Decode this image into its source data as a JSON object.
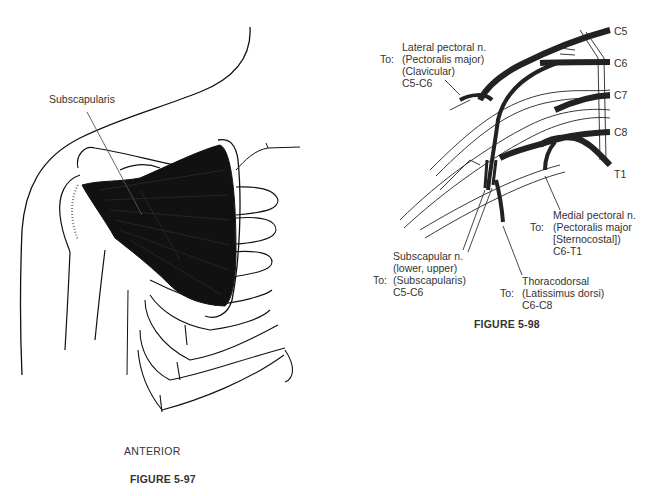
{
  "figure_97": {
    "label_subscapularis": "Subscapularis",
    "view_label": "ANTERIOR",
    "caption": "FIGURE 5-97"
  },
  "figure_98": {
    "caption": "FIGURE 5-98",
    "roots": [
      "C5",
      "C6",
      "C7",
      "C8",
      "T1"
    ],
    "to_prefix": "To:",
    "nerves": [
      {
        "name": "Lateral pectoral n.",
        "target_lines": [
          "(Pectoralis major)",
          "(Clavicular)"
        ],
        "roots": "C5-C6"
      },
      {
        "name": "Medial pectoral n.",
        "target_lines": [
          "(Pectoralis major",
          "[Sternocostal])"
        ],
        "roots": "C6-T1"
      },
      {
        "name": "Subscapular n.",
        "subtitle": "(lower, upper)",
        "target_lines": [
          "(Subscapularis)"
        ],
        "roots": "C5-C6"
      },
      {
        "name": "Thoracodorsal",
        "target_lines": [
          "(Latissimus dorsi)"
        ],
        "roots": "C6-C8"
      }
    ]
  }
}
